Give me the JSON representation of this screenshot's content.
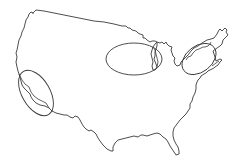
{
  "map": {
    "subject": "Contiguous United States outline",
    "colors": {
      "background": "#ffffff",
      "outline": "#3a3a3a",
      "ellipse": "#3a3a3a"
    },
    "highlighted_regions": [
      {
        "name": "California coast",
        "cx": 36,
        "cy": 93,
        "rx": 14,
        "ry": 25,
        "rotate": -30
      },
      {
        "name": "Great Lakes / Chicago area",
        "cx": 134,
        "cy": 59,
        "rx": 28,
        "ry": 16,
        "rotate": 0
      },
      {
        "name": "Northeast / New England",
        "cx": 199,
        "cy": 59,
        "rx": 19,
        "ry": 13,
        "rotate": -38
      }
    ]
  }
}
